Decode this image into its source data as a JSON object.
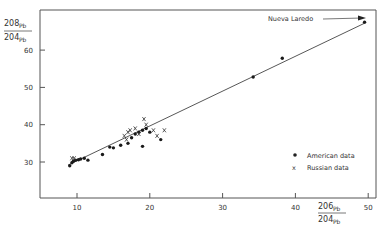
{
  "chart_data": {
    "type": "scatter",
    "title": "",
    "xlabel": "206Pb/204Pb",
    "ylabel": "208Pb/204Pb",
    "x_label_parts": {
      "num_mass": "206",
      "num_el": "Pb",
      "den_mass": "204",
      "den_el": "Pb"
    },
    "y_label_parts": {
      "num_mass": "208",
      "num_el": "Pb",
      "den_mass": "204",
      "den_el": "Pb"
    },
    "xlim": [
      5,
      51
    ],
    "ylim": [
      21,
      70
    ],
    "x_ticks": [
      10,
      20,
      30,
      40,
      50
    ],
    "x_tick_labels": [
      "10",
      "20",
      "30",
      "40",
      "50"
    ],
    "y_ticks": [
      30,
      40,
      50,
      60
    ],
    "y_tick_labels": [
      "30",
      "40",
      "50",
      "60"
    ],
    "grid": false,
    "legend_position": "lower right",
    "annotations": [
      {
        "text": "Nueva Laredo",
        "points_to": [
          49.6,
          67.3
        ]
      }
    ],
    "regression_line": {
      "from": [
        8.8,
        29.2
      ],
      "to": [
        49.6,
        67.3
      ]
    },
    "series": [
      {
        "name": "American data",
        "marker": "dot",
        "points": [
          [
            9.0,
            29.0
          ],
          [
            9.3,
            29.8
          ],
          [
            9.5,
            30.2
          ],
          [
            9.8,
            30.5
          ],
          [
            10.2,
            30.6
          ],
          [
            10.5,
            30.8
          ],
          [
            11.0,
            31.0
          ],
          [
            11.5,
            30.5
          ],
          [
            13.5,
            32.0
          ],
          [
            14.5,
            34.0
          ],
          [
            15.0,
            33.8
          ],
          [
            16.0,
            34.5
          ],
          [
            17.0,
            35.0
          ],
          [
            17.5,
            36.5
          ],
          [
            18.0,
            37.5
          ],
          [
            18.5,
            38.0
          ],
          [
            19.0,
            38.5
          ],
          [
            19.5,
            39.0
          ],
          [
            20.0,
            38.0
          ],
          [
            19.0,
            34.2
          ],
          [
            21.5,
            36.0
          ],
          [
            34.2,
            52.8
          ],
          [
            38.2,
            57.8
          ],
          [
            49.5,
            67.5
          ]
        ]
      },
      {
        "name": "Russian data",
        "marker": "x",
        "points": [
          [
            9.3,
            31.0
          ],
          [
            9.6,
            31.0
          ],
          [
            16.5,
            37.0
          ],
          [
            17.0,
            38.0
          ],
          [
            17.3,
            38.5
          ],
          [
            18.0,
            39.0
          ],
          [
            19.2,
            41.5
          ],
          [
            19.5,
            40.0
          ],
          [
            20.5,
            38.5
          ],
          [
            21.0,
            37.0
          ],
          [
            22.0,
            38.5
          ],
          [
            16.8,
            36.0
          ],
          [
            18.5,
            37.5
          ]
        ]
      }
    ]
  },
  "legend": {
    "american_label": "American data",
    "russian_label": "Russian data",
    "russian_marker": "x"
  },
  "annotation": {
    "label": "Nueva Laredo"
  }
}
